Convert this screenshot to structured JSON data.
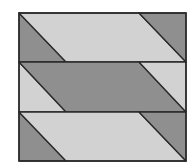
{
  "figure": {
    "colors": {
      "light": "#d2d2d2",
      "dark": "#8f8f8f",
      "stroke": "#2a2a2a",
      "background": "#ffffff"
    },
    "frame": {
      "x": 19,
      "y": 13,
      "width": 167,
      "height": 148
    },
    "bands": [
      {
        "y0": 13,
        "y1": 62,
        "left_triangle": "dark",
        "parallelogram": "light",
        "right_triangle": "dark"
      },
      {
        "y0": 62,
        "y1": 112,
        "left_triangle": "light",
        "parallelogram": "dark",
        "right_triangle": "light"
      },
      {
        "y0": 112,
        "y1": 161,
        "left_triangle": "dark",
        "parallelogram": "light",
        "right_triangle": "dark"
      }
    ],
    "diagonal": {
      "left_top_x": 19,
      "left_bottom_x": 66,
      "right_top_x": 139,
      "right_bottom_x": 186
    }
  }
}
